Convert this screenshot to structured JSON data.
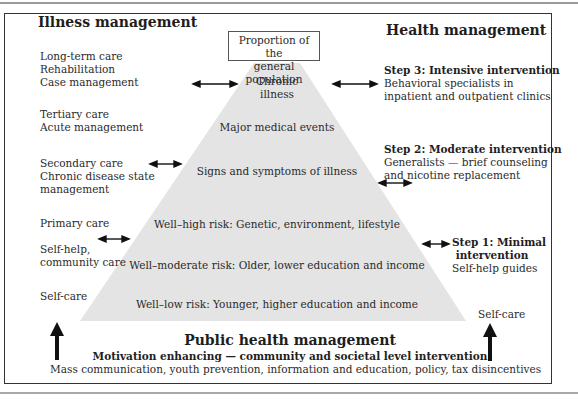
{
  "illness_management": {
    "title": "Illness management",
    "levels": [
      [
        "Long-term care",
        "Rehabilitation",
        "Case management"
      ],
      [
        "Tertiary care",
        "Acute management"
      ],
      [
        "Secondary care",
        "Chronic disease state",
        "management"
      ],
      [
        "Primary care"
      ],
      [
        "Self-help,",
        "community care"
      ],
      [
        "Self-care"
      ]
    ]
  },
  "health_management": {
    "title": "Health management",
    "steps": [
      {
        "title": "Step 3:  Intensive intervention",
        "lines": [
          "Behavioral specialists in",
          "inpatient and outpatient clinics"
        ]
      },
      {
        "title": "Step 2: Moderate intervention",
        "lines": [
          "Generalists — brief counseling",
          "and nicotine replacement"
        ]
      },
      {
        "title_lines": [
          "Step 1: Minimal",
          "intervention"
        ],
        "lines": [
          "Self-help guides"
        ]
      }
    ],
    "self_care": "Self-care"
  },
  "pyramid": {
    "header_lines": [
      "Proportion of the",
      "general population"
    ],
    "fill_color": "#e4e4e4",
    "tiers": [
      [
        "Chronic",
        "illness"
      ],
      [
        "Major medical events"
      ],
      [
        "Signs and symptoms of illness"
      ],
      [
        "Well–high risk: Genetic, environment, lifestyle"
      ],
      [
        "Well–moderate risk: Older, lower education and income"
      ],
      [
        "Well–low risk: Younger, higher education and income"
      ]
    ]
  },
  "public_health": {
    "title": "Public health management",
    "subtitle": "Motivation enhancing — community and societal level intervention",
    "details": "Mass communication, youth prevention, information and education, policy, tax disincentives"
  }
}
